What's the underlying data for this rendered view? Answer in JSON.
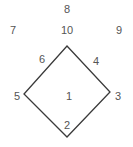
{
  "diagram": {
    "stroke_color": "#3a3a3a",
    "text_color": "#555555",
    "shape": {
      "type": "diamond",
      "vertices": {
        "top": [
          67,
          46
        ],
        "right": [
          110,
          92
        ],
        "bottom": [
          67,
          137
        ],
        "left": [
          24,
          94
        ]
      }
    },
    "labels": [
      {
        "text": "8",
        "x": 67,
        "y": 9
      },
      {
        "text": "7",
        "x": 13,
        "y": 30
      },
      {
        "text": "10",
        "x": 67,
        "y": 30
      },
      {
        "text": "9",
        "x": 119,
        "y": 30
      },
      {
        "text": "6",
        "x": 42,
        "y": 59
      },
      {
        "text": "4",
        "x": 96,
        "y": 61
      },
      {
        "text": "5",
        "x": 17,
        "y": 96
      },
      {
        "text": "1",
        "x": 69,
        "y": 96
      },
      {
        "text": "3",
        "x": 118,
        "y": 96
      },
      {
        "text": "2",
        "x": 67,
        "y": 125
      }
    ]
  }
}
